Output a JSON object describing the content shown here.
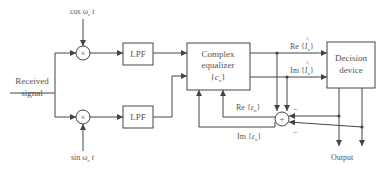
{
  "diagram": {
    "inputs": {
      "received_signal_line1": "Received",
      "received_signal_line2": "signal",
      "cos_carrier": "cos ω",
      "cos_carrier_sub": "c",
      "cos_carrier_t": " t",
      "sin_carrier": "sin ω",
      "sin_carrier_sub": "c",
      "sin_carrier_t": " t"
    },
    "blocks": {
      "mixer_symbol": "×",
      "lpf_top": "LPF",
      "lpf_bottom": "LPF",
      "equalizer_line1": "Complex",
      "equalizer_line2": "equalizer",
      "equalizer_line3_open": "{",
      "equalizer_line3_var": "c",
      "equalizer_line3_sub": "n",
      "equalizer_line3_close": "}",
      "decision_line1": "Decision",
      "decision_line2": "device",
      "summer_symbol": "+"
    },
    "signals": {
      "re_i_prefix": "Re {",
      "re_i_var": "I",
      "re_i_hat": "^",
      "re_i_sub": "n",
      "re_i_suffix": "}",
      "im_i_prefix": "Im {",
      "im_i_var": "I",
      "im_i_hat": "^",
      "im_i_sub": "n",
      "im_i_suffix": "}",
      "re_eps_prefix": "Re {",
      "re_eps_var": "ε",
      "re_eps_sub": "n",
      "re_eps_suffix": "}",
      "im_eps_prefix": "Im {",
      "im_eps_var": "ε",
      "im_eps_sub": "n",
      "im_eps_suffix": "}",
      "minus_top": "−",
      "minus_bottom": "−",
      "output": "Output"
    },
    "colors": {
      "line": "#444444",
      "text": "#555555",
      "background": "#ffffff"
    }
  }
}
